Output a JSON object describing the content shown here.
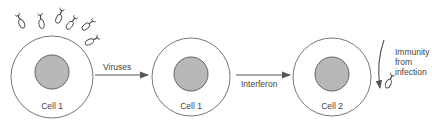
{
  "diagram": {
    "cells": [
      {
        "id": "cell-1-infected",
        "label": "Cell 1"
      },
      {
        "id": "cell-1-producing",
        "label": "Cell 1"
      },
      {
        "id": "cell-2-protected",
        "label": "Cell 2"
      }
    ],
    "arrows": [
      {
        "from": "viruses-attacking",
        "to": "cell-1-producing",
        "label": "Viruses"
      },
      {
        "from": "cell-1-producing",
        "to": "cell-2-protected",
        "label": "Interferon"
      }
    ],
    "outcome": {
      "label_line1": "Immunity",
      "label_line2": "from",
      "label_line3": "infection"
    },
    "colors": {
      "outline": "#555555",
      "nucleus_fill": "#b8b8b8",
      "arrow": "#555555",
      "text": "#444444"
    }
  }
}
